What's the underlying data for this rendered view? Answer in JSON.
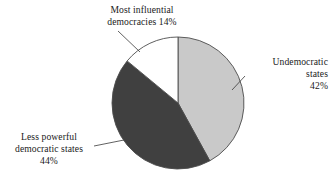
{
  "chart_data": {
    "type": "pie",
    "title": "",
    "categories": [
      "Undemocratic states",
      "Less powerful democratic states",
      "Most influential democracies"
    ],
    "values": [
      42,
      44,
      14
    ],
    "value_labels": [
      "42%",
      "44%",
      "14%"
    ],
    "unit": "%",
    "start_angle_deg": 0,
    "direction": "clockwise",
    "legend": "none",
    "grid": false,
    "slices": [
      {
        "name": "Undemocratic states",
        "value": 42,
        "value_label": "42%",
        "color": "#c9c9c9",
        "start_deg": 0,
        "end_deg": 151.2,
        "label_lines": [
          "Undemocratic",
          "states",
          "42%"
        ]
      },
      {
        "name": "Less powerful democratic states",
        "value": 44,
        "value_label": "44%",
        "color": "#404040",
        "start_deg": 151.2,
        "end_deg": 309.6,
        "label_lines": [
          "Less powerful",
          "democratic states",
          "44%"
        ]
      },
      {
        "name": "Most influential democracies",
        "value": 14,
        "value_label": "14%",
        "color": "#ffffff",
        "start_deg": 309.6,
        "end_deg": 360,
        "label_lines": [
          "Most influential",
          "democracies 14%"
        ]
      }
    ],
    "outline_color": "#4d4d4d"
  },
  "labels": {
    "top": {
      "line1": "Most influential",
      "line2": "democracies 14%"
    },
    "right": {
      "line1": "Undemocratic",
      "line2": "states",
      "line3": "42%"
    },
    "left": {
      "line1": "Less powerful",
      "line2": "democratic states",
      "line3": "44%"
    }
  }
}
